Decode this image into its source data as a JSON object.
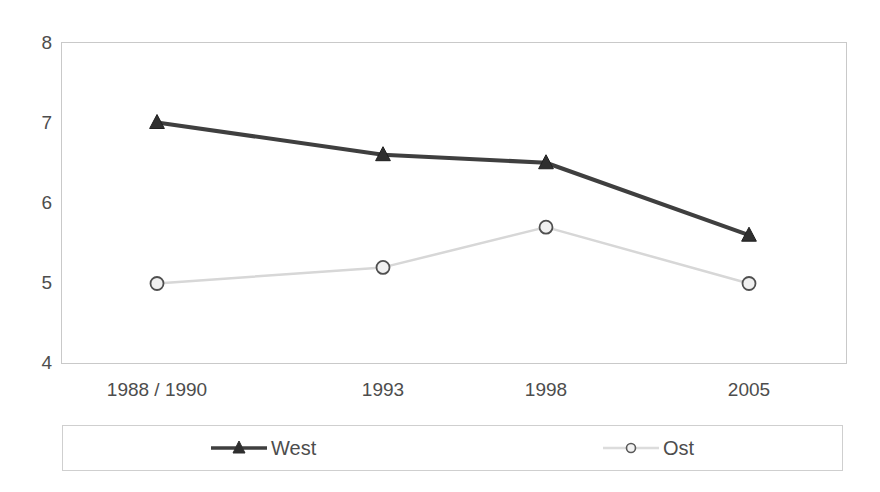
{
  "chart_data": {
    "type": "line",
    "title": "",
    "subtitle": "",
    "xlabel": "",
    "ylabel": "",
    "categories": [
      "1988 / 1990",
      "1993",
      "1998",
      "2005"
    ],
    "series": [
      {
        "name": "West",
        "values": [
          7.0,
          6.6,
          6.5,
          5.6
        ],
        "color": "#3f3f3f",
        "marker": "triangle"
      },
      {
        "name": "Ost",
        "values": [
          5.0,
          5.2,
          5.7,
          5.0
        ],
        "color": "#d7d7d7",
        "marker": "circle"
      }
    ],
    "ylim": [
      4,
      8
    ],
    "yticks": [
      4,
      5,
      6,
      7,
      8
    ],
    "ytick_labels": [
      "4",
      "5",
      "6",
      "7",
      "8"
    ],
    "grid": false,
    "legend_position": "bottom",
    "frame": true
  },
  "legend": {
    "entries": [
      {
        "label": "West",
        "marker": "triangle-marker",
        "color": "#3f3f3f"
      },
      {
        "label": "Ost",
        "marker": "circle-marker",
        "color": "#d7d7d7"
      }
    ]
  },
  "colors": {
    "west_line": "#3f3f3f",
    "ost_line": "#d7d7d7",
    "frame": "#c9c9c9",
    "text": "#4d4d4d",
    "background": "#ffffff"
  }
}
